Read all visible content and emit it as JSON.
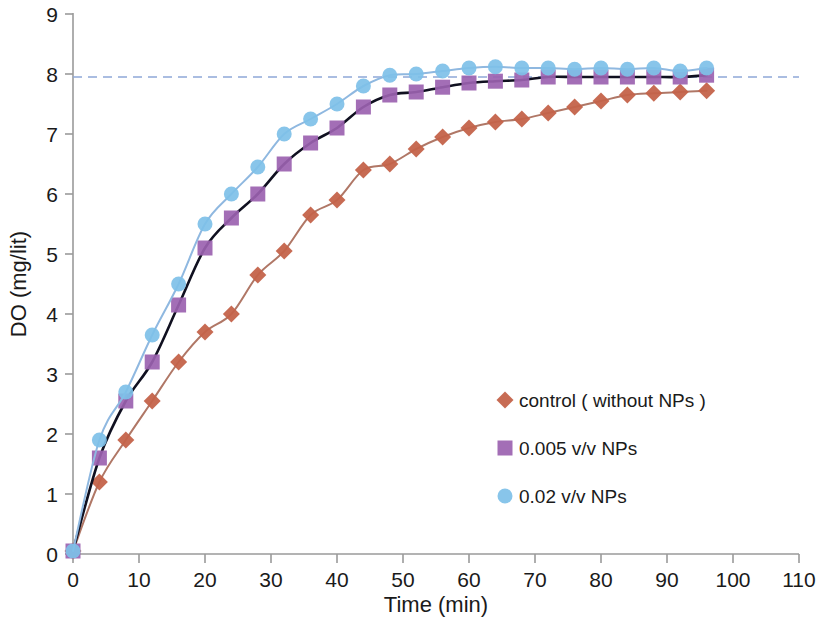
{
  "chart_data": {
    "type": "scatter",
    "title": "",
    "xlabel": "Time (min)",
    "ylabel": "DO (mg/lit)",
    "xlim": [
      0,
      110
    ],
    "ylim": [
      0,
      9
    ],
    "xticks": [
      0,
      10,
      20,
      30,
      40,
      50,
      60,
      70,
      80,
      90,
      100,
      110
    ],
    "yticks": [
      0,
      1,
      2,
      3,
      4,
      5,
      6,
      7,
      8,
      9
    ],
    "grid": false,
    "legend_position": "center-right",
    "x": [
      0,
      4,
      8,
      12,
      16,
      20,
      24,
      28,
      32,
      36,
      40,
      44,
      48,
      52,
      56,
      60,
      64,
      68,
      72,
      76,
      80,
      84,
      88,
      92,
      96
    ],
    "series": [
      {
        "name": "control ( without NPs )",
        "marker": "diamond",
        "color": "#C4634A",
        "fit_line_color": "#B07766",
        "values": [
          0.05,
          1.2,
          1.9,
          2.55,
          3.2,
          3.7,
          4.0,
          4.65,
          5.05,
          5.65,
          5.9,
          6.4,
          6.5,
          6.75,
          6.95,
          7.1,
          7.2,
          7.25,
          7.35,
          7.45,
          7.55,
          7.65,
          7.68,
          7.7,
          7.72
        ]
      },
      {
        "name": "0.005 v/v NPs",
        "marker": "square",
        "color": "#9B62B0",
        "fit_line_color": "#101020",
        "values": [
          0.05,
          1.6,
          2.55,
          3.2,
          4.15,
          5.1,
          5.6,
          6.0,
          6.5,
          6.85,
          7.1,
          7.45,
          7.65,
          7.7,
          7.78,
          7.85,
          7.88,
          7.9,
          7.95,
          7.95,
          7.95,
          7.95,
          7.95,
          7.95,
          7.98
        ]
      },
      {
        "name": "0.02 v/v NPs",
        "marker": "circle",
        "color": "#7EC0E8",
        "fit_line_color": "#8FB8E0",
        "values": [
          0.05,
          1.9,
          2.7,
          3.65,
          4.5,
          5.5,
          6.0,
          6.45,
          7.0,
          7.25,
          7.5,
          7.8,
          7.98,
          8.0,
          8.05,
          8.1,
          8.12,
          8.1,
          8.1,
          8.08,
          8.1,
          8.08,
          8.1,
          8.05,
          8.1
        ]
      }
    ],
    "annotations": [
      {
        "name": "saturation-reference-line",
        "type": "horizontal-dashed-line",
        "y": 7.95,
        "x_start": 0,
        "x_end": 110,
        "color": "#8FA8D8"
      }
    ]
  },
  "legend": {
    "items": [
      {
        "label": "control ( without NPs )",
        "marker": "diamond-marker-icon",
        "color": "#C4634A"
      },
      {
        "label": "0.005 v/v NPs",
        "marker": "square-marker-icon",
        "color": "#9B62B0"
      },
      {
        "label": "0.02 v/v NPs",
        "marker": "circle-marker-icon",
        "color": "#7EC0E8"
      }
    ]
  },
  "axes": {
    "x_title": "Time (min)",
    "y_title": "DO (mg/lit)",
    "x_tick_labels": [
      "0",
      "10",
      "20",
      "30",
      "40",
      "50",
      "60",
      "70",
      "80",
      "90",
      "100",
      "110"
    ],
    "y_tick_labels": [
      "0",
      "1",
      "2",
      "3",
      "4",
      "5",
      "6",
      "7",
      "8",
      "9"
    ],
    "axis_color": "#9a9a9a"
  }
}
